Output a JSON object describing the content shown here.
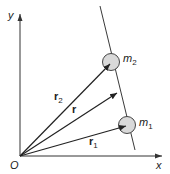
{
  "diagram": {
    "type": "vector-position-diagram",
    "axes": {
      "x_label": "x",
      "y_label": "y",
      "origin_label": "O"
    },
    "masses": [
      {
        "id": "m1",
        "label_main": "m",
        "label_sub": "1"
      },
      {
        "id": "m2",
        "label_main": "m",
        "label_sub": "2"
      }
    ],
    "vectors": [
      {
        "id": "r1",
        "label_main": "r",
        "label_sub": "1"
      },
      {
        "id": "r2",
        "label_main": "r",
        "label_sub": "2"
      },
      {
        "id": "r",
        "label_main": "r",
        "label_sub": ""
      }
    ],
    "colors": {
      "line": "#222222",
      "axis": "#333333",
      "mass_fill": "#d9d9d9",
      "mass_stroke": "#444444"
    }
  }
}
